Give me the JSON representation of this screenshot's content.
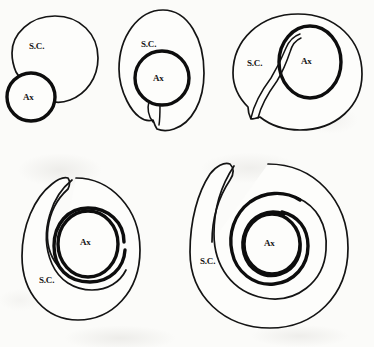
{
  "figure": {
    "background_color": "#fbfbf9",
    "ink_color": "#141414",
    "rows": 2,
    "columns_top": 3,
    "columns_bottom": 2,
    "total_panels": 5
  },
  "labels": {
    "schwann_cell": "S.C.",
    "axon": "Ax"
  },
  "panels": [
    {
      "index": 1,
      "stage": "apposition",
      "description": "Schwann cell and axon adjacent, axon beginning to indent the Schwann cell surface",
      "wraps": 0,
      "mesaxon": false,
      "sc_label": "S.C.",
      "ax_label": "Ax"
    },
    {
      "index": 2,
      "stage": "engulfment",
      "description": "Axon enclosed within the Schwann cell; short mesaxon formed below the axon",
      "wraps": 0,
      "mesaxon": true,
      "sc_label": "S.C.",
      "ax_label": "Ax"
    },
    {
      "index": 3,
      "stage": "mesaxon-elongation",
      "description": "Axon fully internalised; elongated mesaxon sweeps from the cell surface up the left side of the axon",
      "wraps": 0,
      "mesaxon": true,
      "sc_label": "S.C.",
      "ax_label": "Ax"
    },
    {
      "index": 4,
      "stage": "first-wrap",
      "description": "Inner mesaxon has rotated once around the axon forming a single myelin lamella",
      "wraps": 1,
      "mesaxon": true,
      "sc_label": "S.C.",
      "ax_label": "Ax"
    },
    {
      "index": 5,
      "stage": "second-wrap",
      "description": "Mesaxon has spiralled twice around the axon forming two myelin lamellae",
      "wraps": 2,
      "mesaxon": true,
      "sc_label": "S.C.",
      "ax_label": "Ax"
    }
  ]
}
